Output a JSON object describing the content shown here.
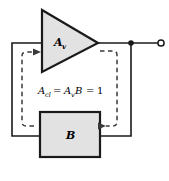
{
  "figure": {
    "background_color": "#ffffff",
    "line_color": "#1a1a1a",
    "fill_color": "#e2e2e2",
    "dashed_color": "#3a3a3a"
  },
  "amplifier": {
    "shape": "triangle",
    "label_base": "A",
    "label_sub": "v",
    "label_full": "Av"
  },
  "feedback_block": {
    "shape": "rectangle",
    "label": "B"
  },
  "equation": {
    "lhs_base": "A",
    "lhs_sub": "cl",
    "eq1": "=",
    "rhs_base": "A",
    "rhs_sub": "v",
    "rhs_factor": "B",
    "eq2": "=",
    "result": "1",
    "full": "Acl = AvB = 1"
  },
  "output_terminal": {
    "type": "open-circle",
    "junction": "filled-dot"
  },
  "annotations": {
    "loop_path": "dashed-feedback-loop",
    "arrow_into_amp": "arrow-right",
    "arrow_into_block": "arrow-right"
  }
}
